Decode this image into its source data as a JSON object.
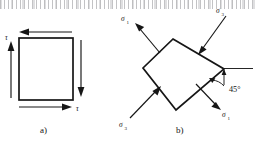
{
  "figure": {
    "background_color": "#ffffff",
    "ink_color": "#161616",
    "width": 256,
    "height": 141
  },
  "panel_a": {
    "caption": "a)",
    "description": "square element loaded in pure shear",
    "labels": {
      "shear_left": "τ",
      "shear_bottom": "τ"
    },
    "arrows": [
      {
        "name": "top-shear-arrow",
        "direction": "left",
        "edge": "top"
      },
      {
        "name": "right-shear-arrow",
        "direction": "down",
        "edge": "right"
      },
      {
        "name": "bottom-shear-arrow",
        "direction": "right",
        "edge": "bottom"
      },
      {
        "name": "left-shear-arrow",
        "direction": "up",
        "edge": "left"
      }
    ]
  },
  "panel_b": {
    "caption": "b)",
    "description": "element rotated 45 degrees showing principal stresses",
    "labels": {
      "stress_top_left": "σ",
      "stress_top_left_sub": "1",
      "stress_top_right": "σ",
      "stress_top_right_sub": "3",
      "stress_bottom_left": "σ",
      "stress_bottom_left_sub": "3",
      "stress_bottom_right": "σ",
      "stress_bottom_right_sub": "1",
      "angle": "45°"
    },
    "arrows": [
      {
        "name": "principal-tension-arrow-top-left",
        "direction": "outward-up-left",
        "stress": "σ₁"
      },
      {
        "name": "principal-compression-arrow-top-right",
        "direction": "inward-down-left",
        "stress": "σ₃"
      },
      {
        "name": "principal-compression-arrow-bottom-left",
        "direction": "inward-up-right",
        "stress": "σ₃"
      },
      {
        "name": "principal-tension-arrow-bottom-right",
        "direction": "outward-down-right",
        "stress": "σ₁"
      }
    ],
    "reference_line": "horizontal-datum"
  }
}
